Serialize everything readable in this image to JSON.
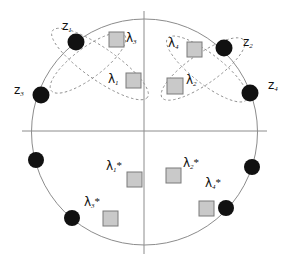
{
  "figure": {
    "name": "unit-circle-eigenvalue-diagram",
    "background": "#ffffff",
    "width": 290,
    "height": 263,
    "circle": {
      "cx": 144.5,
      "cy": 132,
      "r": 113,
      "stroke": "#8c8c8c",
      "stroke_width": 1
    },
    "axes": {
      "horizontal": {
        "x1": 22,
        "y1": 131,
        "x2": 267,
        "y2": 131
      },
      "vertical": {
        "x1": 144,
        "y1": 11,
        "x2": 144,
        "y2": 254
      },
      "stroke": "#8c8c8c"
    },
    "colors": {
      "dot_fill": "#111111",
      "square_fill": "#c9c9c9",
      "square_stroke": "#7a7a7a",
      "ellipse_stroke": "#8d8d8d",
      "axis_stroke": "#8c8c8c",
      "label_color": "#111111"
    }
  },
  "markers": {
    "dots_name": "eigenvalue-dot",
    "dots": [
      {
        "id": "z1",
        "cx": 76,
        "cy": 42,
        "r": 8.5
      },
      {
        "id": "z3",
        "cx": 41,
        "cy": 95,
        "r": 8.5
      },
      {
        "id": "z2",
        "cx": 224,
        "cy": 48,
        "r": 8.5
      },
      {
        "id": "z4",
        "cx": 250,
        "cy": 93,
        "r": 8.5
      },
      {
        "id": "d5",
        "cx": 36,
        "cy": 160,
        "r": 8.0
      },
      {
        "id": "d6",
        "cx": 72,
        "cy": 218,
        "r": 8.0
      },
      {
        "id": "d7",
        "cx": 252,
        "cy": 167,
        "r": 8.0
      },
      {
        "id": "d8",
        "cx": 226,
        "cy": 208,
        "r": 8.0
      }
    ],
    "squares_name": "lambda-square",
    "squares": [
      {
        "id": "lam3",
        "x": 109,
        "y": 32,
        "w": 15,
        "h": 15
      },
      {
        "id": "lam1",
        "x": 126,
        "y": 73,
        "w": 15,
        "h": 15
      },
      {
        "id": "lam4",
        "x": 187,
        "y": 42,
        "w": 15,
        "h": 15
      },
      {
        "id": "lam2",
        "x": 167,
        "y": 78,
        "w": 16,
        "h": 16
      },
      {
        "id": "lam1star",
        "x": 127,
        "y": 172,
        "w": 15,
        "h": 15
      },
      {
        "id": "lam2star",
        "x": 166,
        "y": 168,
        "w": 15,
        "h": 15
      },
      {
        "id": "lam3star",
        "x": 103,
        "y": 211,
        "w": 15,
        "h": 15
      },
      {
        "id": "lam4star",
        "x": 199,
        "y": 201,
        "w": 15,
        "h": 15
      }
    ]
  },
  "ellipses": {
    "name": "dashed-ellipse",
    "stroke": "#8d8d8d",
    "dash": "2.5,2.5",
    "items": [
      {
        "id": "left-ellipse-a",
        "cx": 100,
        "cy": 64,
        "rx": 58,
        "ry": 16,
        "rotate": 35
      },
      {
        "id": "left-ellipse-b",
        "cx": 88,
        "cy": 63,
        "rx": 46,
        "ry": 15,
        "rotate": -37
      },
      {
        "id": "right-ellipse-a",
        "cx": 207,
        "cy": 69,
        "rx": 50,
        "ry": 15,
        "rotate": 38
      },
      {
        "id": "right-ellipse-b",
        "cx": 203,
        "cy": 69,
        "rx": 50,
        "ry": 15,
        "rotate": -35
      }
    ]
  },
  "labels": {
    "z1": {
      "text": "z",
      "sub": "1",
      "x": 62,
      "y": 20
    },
    "z2": {
      "text": "z",
      "sub": "2",
      "x": 243,
      "y": 36
    },
    "z3": {
      "text": "z",
      "sub": "3",
      "x": 14,
      "y": 84
    },
    "z4": {
      "text": "z",
      "sub": "4",
      "x": 268,
      "y": 79
    },
    "lam3": {
      "text": "λ",
      "sub": "3",
      "x": 126,
      "y": 32
    },
    "lam1": {
      "text": "λ",
      "sub": "1",
      "x": 108,
      "y": 73
    },
    "lam4": {
      "text": "λ",
      "sub": "4",
      "x": 168,
      "y": 37
    },
    "lam2": {
      "text": "λ",
      "sub": "2",
      "x": 186,
      "y": 74
    },
    "lam1star": {
      "text": "λ",
      "sub": "1",
      "star": "*",
      "x": 106,
      "y": 160
    },
    "lam2star": {
      "text": "λ",
      "sub": "2",
      "star": "*",
      "x": 183,
      "y": 157
    },
    "lam3star": {
      "text": "λ",
      "sub": "3",
      "star": "*",
      "x": 84,
      "y": 196
    },
    "lam4star": {
      "text": "λ",
      "sub": "4",
      "star": "*",
      "x": 205,
      "y": 177
    }
  }
}
